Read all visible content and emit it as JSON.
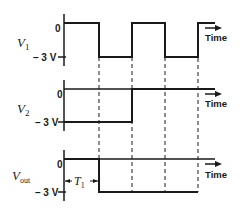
{
  "diagram": {
    "type": "timing-diagram",
    "time_label": "Time",
    "zero_label": "0",
    "low_label": "– 3 V",
    "signals": [
      {
        "name": "V",
        "sub": "1",
        "levels": "0 until t1, -3V t1-t2, 0 t2-t3, -3V t3-t4, 0 after"
      },
      {
        "name": "V",
        "sub": "2",
        "levels": "-3V until t2, 0 after"
      },
      {
        "name": "V",
        "sub": "out",
        "levels": "0 until t1, -3V t1-t4"
      }
    ],
    "annotation": {
      "name": "T",
      "sub": "1"
    }
  }
}
